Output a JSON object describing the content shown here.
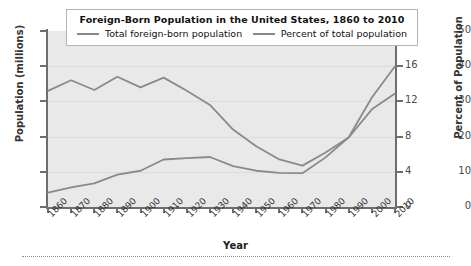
{
  "chart_data": {
    "type": "line",
    "title": "Foreign-Born Population in the United States, 1860 to 2010",
    "xlabel": "Year",
    "ylabel": "Population (millions)",
    "ylabel_right": "Percent of Population",
    "grid": true,
    "legend_position": "top",
    "x": [
      1860,
      1870,
      1880,
      1890,
      1900,
      1910,
      1920,
      1930,
      1940,
      1950,
      1960,
      1970,
      1980,
      1990,
      2000,
      2010
    ],
    "xtick_labels": [
      "1860",
      "1870",
      "1880",
      "1890",
      "1900",
      "1910",
      "1920",
      "1930",
      "1940",
      "1950",
      "1960",
      "1970",
      "1980",
      "1990",
      "2000",
      "2010"
    ],
    "ylim": [
      0,
      50
    ],
    "ytick_labels": [
      "0",
      "10",
      "20",
      "30",
      "40",
      "50"
    ],
    "ytick_values": [
      0,
      10,
      20,
      30,
      40,
      50
    ],
    "ylim_right": [
      0,
      20
    ],
    "ytick_labels_right": [
      "0",
      "4",
      "8",
      "12",
      "16",
      "20"
    ],
    "ytick_values_right": [
      0,
      4,
      8,
      12,
      16,
      20
    ],
    "series": [
      {
        "name": "Total foreign-born population",
        "axis": "left",
        "units": "millions",
        "color": "#8a8a8a",
        "values": [
          4.1,
          5.6,
          6.7,
          9.2,
          10.3,
          13.5,
          13.9,
          14.2,
          11.6,
          10.3,
          9.7,
          9.6,
          14.1,
          19.8,
          31.1,
          40.0
        ]
      },
      {
        "name": "Percent of total population",
        "axis": "right",
        "units": "percent",
        "color": "#8a8a8a",
        "values": [
          13.2,
          14.4,
          13.3,
          14.8,
          13.6,
          14.7,
          13.2,
          11.6,
          8.8,
          6.9,
          5.4,
          4.7,
          6.2,
          7.9,
          11.1,
          12.9
        ]
      }
    ]
  },
  "legend": {
    "title": "Foreign-Born Population in the United States, 1860 to 2010",
    "entries": [
      {
        "label": "Total foreign-born population"
      },
      {
        "label": "Percent of total population"
      }
    ]
  },
  "axes": {
    "left_title": "Population (millions)",
    "right_title": "Percent of Population",
    "bottom_title": "Year"
  }
}
